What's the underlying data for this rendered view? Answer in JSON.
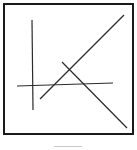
{
  "figure": {
    "frame": {
      "x": 4,
      "y": 4,
      "width": 129,
      "height": 130,
      "stroke": "#1a1a1a",
      "stroke_width": 2
    },
    "line_color": "#2a2a2a",
    "lines": [
      {
        "name": "vertical-line",
        "x1": 32,
        "y1": 20,
        "x2": 33,
        "y2": 110
      },
      {
        "name": "horizontal-line",
        "x1": 17,
        "y1": 86,
        "x2": 113,
        "y2": 83
      },
      {
        "name": "rising-diagonal",
        "x1": 40,
        "y1": 99,
        "x2": 124,
        "y2": 15
      },
      {
        "name": "falling-diagonal",
        "x1": 62,
        "y1": 62,
        "x2": 127,
        "y2": 128
      }
    ]
  },
  "caption": {
    "text": ""
  }
}
